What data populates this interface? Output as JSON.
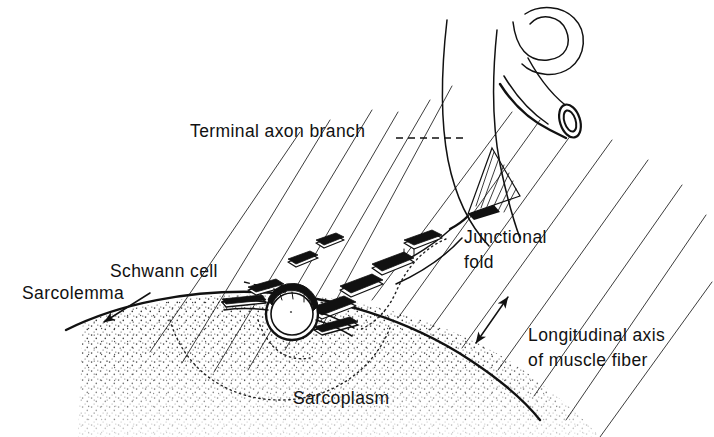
{
  "figure": {
    "background_color": "#ffffff",
    "ink_color": "#111111"
  },
  "labels": {
    "terminal_axon_branch": "Terminal axon branch",
    "junctional_fold_line1": "Junctional",
    "junctional_fold_line2": "fold",
    "schwann_cell": "Schwann cell",
    "sarcolemma": "Sarcolemma",
    "longitudinal_axis_line1": "Longitudinal axis",
    "longitudinal_axis_line2": "of muscle fiber",
    "sarcoplasm": "Sarcoplasm"
  },
  "annotations": {
    "leader_styles": {
      "terminal_axon_branch": "dashed",
      "schwann_cell": "dashed",
      "sarcolemma": "arrow",
      "junctional_fold": "dotted",
      "longitudinal_axis": "double-headed-arrow"
    }
  },
  "structures": {
    "nerve_trunk": "curved myelinated nerve fiber entering from top right",
    "cut_end": "elliptical cut end of nerve fiber",
    "axon_cross_section": "circular terminal axon profile at synapse",
    "junctional_folds_count": 7,
    "muscle_striations_count": 14,
    "sarcoplasm_fill": "stippled"
  }
}
